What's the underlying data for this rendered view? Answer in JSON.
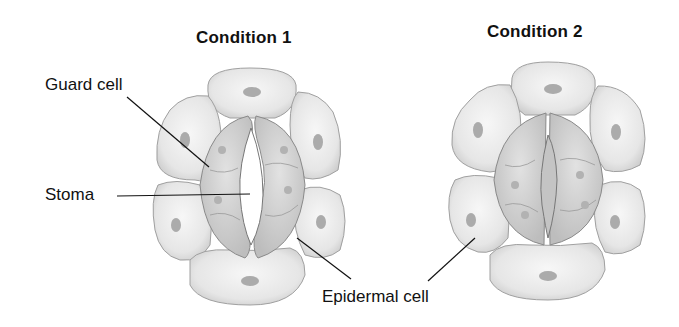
{
  "diagram": {
    "panels": [
      {
        "title": "Condition 1",
        "state": "stoma open"
      },
      {
        "title": "Condition 2",
        "state": "stoma closed"
      }
    ],
    "labels": {
      "guard_cell": "Guard cell",
      "stoma": "Stoma",
      "epidermal_cell": "Epidermal cell"
    },
    "colors": {
      "background": "#ffffff",
      "cell_fill": "#ececec",
      "cell_edge": "#9a9a9a",
      "nucleus": "#a8a8a8",
      "guard_fill": "#d6d6d6",
      "text": "#111111"
    }
  }
}
